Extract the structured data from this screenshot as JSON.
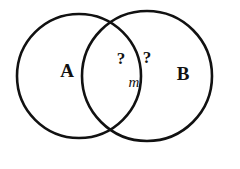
{
  "figure": {
    "name": "venn-diagram-two-sets",
    "background_color": "#ffffff",
    "outline_color": "#111111",
    "shade_color": "#b2b2b2",
    "width": 240,
    "height": 169
  },
  "sets": [
    {
      "id": "set-a",
      "label": "A",
      "fill": "shaded",
      "fill_color": "#b2b2b2",
      "cx": 79,
      "cy": 76,
      "r": 62,
      "label_x": 67,
      "label_y": 73
    },
    {
      "id": "set-b",
      "label": "B",
      "fill": "white",
      "fill_color": "#ffffff",
      "cx": 147,
      "cy": 76,
      "r": 65,
      "label_x": 183,
      "label_y": 76
    }
  ],
  "annotations": [
    {
      "id": "question-left",
      "text": "?",
      "x": 121,
      "y": 60
    },
    {
      "id": "question-right",
      "text": "?",
      "x": 147,
      "y": 59
    },
    {
      "id": "measure-m",
      "text": "m",
      "x": 134,
      "y": 84
    }
  ]
}
